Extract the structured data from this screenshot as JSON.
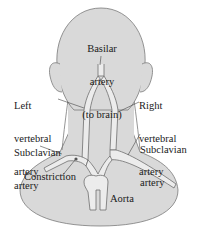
{
  "diagram": {
    "colors": {
      "skin_fill": "#d9d9d9",
      "outline": "#6e6e6e",
      "artery_fill": "#ececec",
      "text": "#1a1a1a",
      "background": "#ffffff"
    },
    "labels": {
      "basilar": {
        "line1": "Basilar",
        "line2": "artery",
        "line3": "(to brain)"
      },
      "left_vertebral": {
        "line1": "Left",
        "line2": "vertebral",
        "line3": "artery"
      },
      "right_vertebral": {
        "line1": "Right",
        "line2": "vertebral",
        "line3": "artery"
      },
      "left_subclavian": {
        "line1": "Subclavian",
        "line2": "artery"
      },
      "right_subclavian": {
        "line1": "Subclavian",
        "line2": "artery"
      },
      "constriction": "Constriction",
      "aorta": "Aorta"
    }
  }
}
